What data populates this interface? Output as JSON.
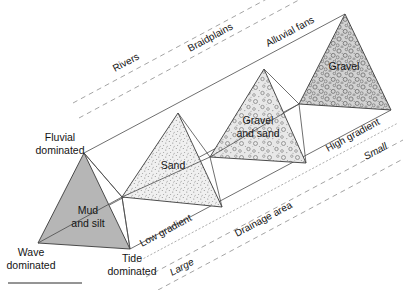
{
  "figure": {
    "bottom_rule": true
  },
  "prism_units": [
    {
      "id": "mud-and-silt",
      "label_line1": "Mud",
      "label_line2": "and silt",
      "fill": "#b6b6b6",
      "texture": "solid-gray"
    },
    {
      "id": "sand",
      "label_line1": "Sand",
      "label_line2": "",
      "fill": "#ededed",
      "texture": "fine-stipple"
    },
    {
      "id": "gravel-and-sand",
      "label_line1": "Gravel",
      "label_line2": "and sand",
      "fill": "#e2e2e2",
      "texture": "mixed-circles-dots"
    },
    {
      "id": "gravel",
      "label_line1": "Gravel",
      "label_line2": "",
      "fill": "#cfcfcf",
      "texture": "dense-pebbles"
    }
  ],
  "corner_labels": [
    {
      "id": "fluvial",
      "line1": "Fluvial",
      "line2": "dominated"
    },
    {
      "id": "wave",
      "line1": "Wave",
      "line2": "dominated"
    },
    {
      "id": "tide",
      "line1": "Tide",
      "line2": "dominated"
    }
  ],
  "top_axis": {
    "line_style": "dashed",
    "items": [
      {
        "id": "rivers",
        "label": "Rivers"
      },
      {
        "id": "braidplains",
        "label": "Braidplains"
      },
      {
        "id": "alluvial-fans",
        "label": "Alluvial fans"
      }
    ]
  },
  "gradient_axis": {
    "line_style": "dotted",
    "low_label": "Low gradient",
    "high_label": "High gradient"
  },
  "drainage_axis": {
    "line_style": "dashed",
    "axis_label": "Drainage area",
    "large_label": "Large",
    "small_label": "Small"
  },
  "colors": {
    "outline": "#4a4a4a",
    "triangle_edge": "#3a3a3a",
    "dashed_guide": "#8d8d8d",
    "dotted_guide": "#9a9a9a",
    "text": "#141414",
    "background": "#ffffff"
  }
}
